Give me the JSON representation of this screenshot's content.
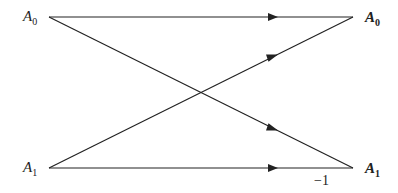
{
  "diagram": {
    "type": "butterfly",
    "inputs": [
      {
        "id": "in0",
        "base": "A",
        "sub": "0"
      },
      {
        "id": "in1",
        "base": "A",
        "sub": "1"
      }
    ],
    "outputs": [
      {
        "id": "out0",
        "base": "A",
        "sub": "0"
      },
      {
        "id": "out1",
        "base": "A",
        "sub": "1"
      }
    ],
    "edges": [
      {
        "from": "in0",
        "to": "out0",
        "weight": ""
      },
      {
        "from": "in0",
        "to": "out1",
        "weight": ""
      },
      {
        "from": "in1",
        "to": "out0",
        "weight": ""
      },
      {
        "from": "in1",
        "to": "out1",
        "weight": "−1"
      }
    ],
    "coefficient_label": "−1",
    "line_color": "#222222"
  }
}
